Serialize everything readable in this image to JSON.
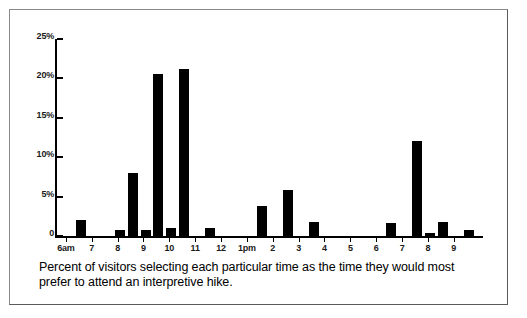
{
  "figure": {
    "caption": "Percent of visitors selecting each particular time as the time they would most prefer to attend an interpretive hike.",
    "border_color": "#8a8a8a",
    "bar_color": "#000000"
  },
  "chart_data": {
    "type": "bar",
    "title": "",
    "subtitle": "",
    "xlabel": "",
    "ylabel": "",
    "ylim": [
      0,
      25
    ],
    "grid": false,
    "legend": null,
    "y_ticks": [
      0,
      5,
      10,
      15,
      20,
      25
    ],
    "y_tick_labels": [
      "0",
      "5%",
      "10%",
      "15%",
      "20%",
      "25%"
    ],
    "x_tick_labels": [
      "6am",
      "7",
      "8",
      "9",
      "10",
      "11",
      "12",
      "1pm",
      "2",
      "3",
      "4",
      "5",
      "6",
      "7",
      "8",
      "9"
    ],
    "categories": [
      "6am",
      "6:30am",
      "7am",
      "7:30am",
      "8am",
      "8:30am",
      "9am",
      "9:30am",
      "10am",
      "10:30am",
      "11am",
      "11:30am",
      "12pm",
      "12:30pm",
      "1pm",
      "1:30pm",
      "2pm",
      "2:30pm",
      "3pm",
      "3:30pm",
      "4pm",
      "4:30pm",
      "5pm",
      "5:30pm",
      "6pm",
      "6:30pm",
      "7pm",
      "7:30pm",
      "8pm",
      "8:30pm",
      "9pm"
    ],
    "values": [
      2.0,
      0.0,
      0.0,
      0.8,
      8.0,
      0.8,
      20.6,
      1.0,
      21.2,
      0.0,
      1.0,
      0.0,
      0.0,
      0.0,
      3.8,
      0.0,
      5.9,
      0.0,
      1.8,
      0.0,
      0.0,
      0.0,
      0.0,
      0.0,
      1.7,
      0.0,
      12.0,
      0.4,
      1.8,
      0.0,
      0.8
    ],
    "units": "percent"
  }
}
